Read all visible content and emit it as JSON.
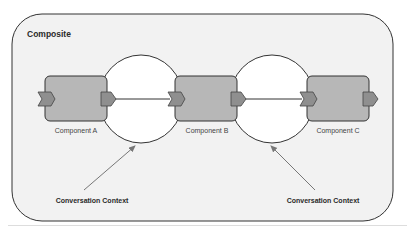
{
  "composite": {
    "title": "Composite",
    "background": "#f2f2f2",
    "border": "#333333"
  },
  "components": [
    {
      "id": "A",
      "label": "Component A",
      "fill": "#b7b7b7"
    },
    {
      "id": "B",
      "label": "Component B",
      "fill": "#b7b7b7"
    },
    {
      "id": "C",
      "label": "Component C",
      "fill": "#b7b7b7"
    }
  ],
  "ports": {
    "fill": "#8f8f8f",
    "stroke": "#444444"
  },
  "wires": [
    {
      "from": "Component A",
      "to": "Component B"
    },
    {
      "from": "Component B",
      "to": "Component C"
    }
  ],
  "contexts": [
    {
      "label": "Conversation Context",
      "spans": [
        "Component A",
        "Component B"
      ]
    },
    {
      "label": "Conversation Context",
      "spans": [
        "Component B",
        "Component C"
      ]
    }
  ],
  "colors": {
    "context_fill": "#ffffff",
    "arrow": "#777777",
    "line": "#333333"
  }
}
